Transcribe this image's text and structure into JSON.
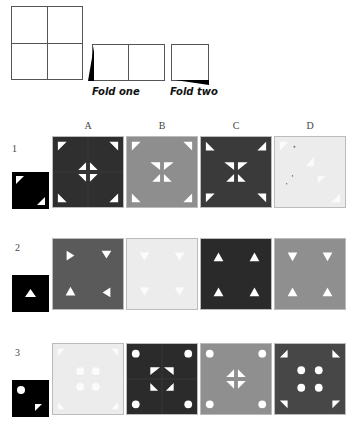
{
  "diagram": {
    "fold_labels": {
      "fold_one": "Fold one",
      "fold_two": "Fold two"
    },
    "column_headers": [
      "A",
      "B",
      "C",
      "D"
    ],
    "rows": [
      {
        "number": "1",
        "answer_colors": [
          "#2f2f2f",
          "#8e8e8e",
          "#3a3a3a",
          "#ececec"
        ]
      },
      {
        "number": "2",
        "answer_colors": [
          "#5a5a5a",
          "#ececec",
          "#2a2a2a",
          "#8f8f8f"
        ]
      },
      {
        "number": "3",
        "answer_colors": [
          "#ececec",
          "#2b2b2b",
          "#8f8f8f",
          "#474747"
        ]
      }
    ]
  }
}
